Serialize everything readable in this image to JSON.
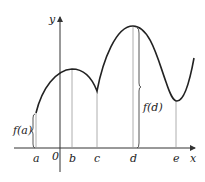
{
  "diagram": {
    "type": "function-graph-extrema",
    "axes": {
      "x_label": "x",
      "y_label": "y",
      "origin_label": "0"
    },
    "x_points": [
      {
        "label": "a",
        "x": 36
      },
      {
        "label": "b",
        "x": 72
      },
      {
        "label": "c",
        "x": 97
      },
      {
        "label": "d",
        "x": 133
      },
      {
        "label": "e",
        "x": 176
      }
    ],
    "annotations": {
      "f_a": "f(a)",
      "f_d": "f(d)"
    },
    "colors": {
      "curve": "#222222",
      "axis": "#333333",
      "guide": "#999999"
    }
  }
}
